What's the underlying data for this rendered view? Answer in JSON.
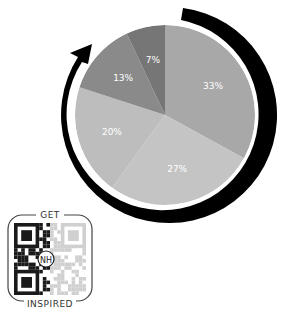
{
  "chart_data": {
    "type": "pie",
    "title": "",
    "categories": [
      "Slice A",
      "Slice B",
      "Slice C",
      "Slice D",
      "Slice E"
    ],
    "values": [
      33,
      27,
      20,
      13,
      7
    ],
    "labels": [
      "33%",
      "27%",
      "20%",
      "13%",
      "7%"
    ],
    "colors": [
      "#a8a8a8",
      "#c4c4c4",
      "#bdbdbd",
      "#8a8a8a",
      "#767676"
    ],
    "start_angle": "12 o'clock",
    "direction": "clockwise",
    "legend": "none",
    "annotations": [
      "Black circular arrow surrounding the pie, clockwise, ending in an arrowhead at the upper-left"
    ]
  },
  "badge": {
    "top_text": "GET",
    "bottom_text": "INSPIRED",
    "center_logo": "NH"
  }
}
